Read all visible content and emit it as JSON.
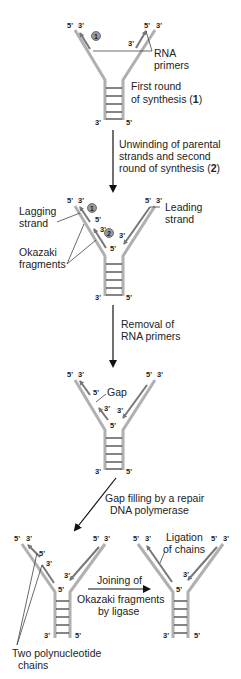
{
  "figure": {
    "stages": [
      {
        "id": "stage1",
        "labels": {
          "end_tl_5": "5'",
          "end_tl_3": "3'",
          "end_tr_5": "5'",
          "end_tr_3": "3'",
          "end_bl": "3'",
          "end_br": "5'",
          "primer_3": "3'",
          "marker": "1",
          "rna_primers_l1": "RNA",
          "rna_primers_l2": "primers",
          "desc_l1": "First round",
          "desc_l2": "of synthesis (",
          "desc_num": "1",
          "desc_close": ")"
        }
      },
      {
        "id": "stage2",
        "labels": {
          "end_tl_5": "5'",
          "end_tl_3": "3'",
          "end_tr_5": "5'",
          "end_tr_3": "3'",
          "end_bl": "3'",
          "end_br": "5'",
          "frag1_5": "5'",
          "frag2_3": "3'",
          "frag2_5": "5'",
          "lead_3": "3'",
          "marker1": "1",
          "marker2": "2",
          "lagging_l1": "Lagging",
          "lagging_l2": "strand",
          "leading_l1": "Leading",
          "leading_l2": "strand",
          "okazaki_l1": "Okazaki",
          "okazaki_l2": "fragments"
        }
      },
      {
        "id": "stage3",
        "labels": {
          "end_tl_5": "5'",
          "end_tl_3": "3'",
          "end_tr_5": "5'",
          "end_tr_3": "3'",
          "end_bl": "3'",
          "end_br": "5'",
          "frag1_5": "5'",
          "frag2_3": "3'",
          "frag2_5": "5'",
          "lead_3": "3'",
          "gap": "Gap"
        }
      },
      {
        "id": "stage4",
        "labels": {
          "end_tl_5": "5'",
          "end_tl_3": "3'",
          "end_tr_5": "5'",
          "end_tr_3": "3'",
          "end_bl": "3'",
          "end_br": "5'",
          "frag1_5": "5'",
          "frag2_3": "3'",
          "frag2_5": "5'",
          "lead_3": "3'",
          "two_chains_l1": "Two polynucleotide",
          "two_chains_l2": "chains"
        }
      },
      {
        "id": "stage5",
        "labels": {
          "end_tl_5": "5'",
          "end_tl_3": "3'",
          "end_tr_5": "5'",
          "end_tr_3": "3'",
          "end_bl": "3'",
          "end_br": "5'",
          "frag_5": "5'",
          "lead_3": "3'",
          "ligation_l1": "Ligation",
          "ligation_l2": "of chains"
        }
      }
    ],
    "steps": {
      "step1_l1": "Unwinding of parental",
      "step1_l2": "strands and second",
      "step1_l3": "round of synthesis (",
      "step1_num": "2",
      "step1_close": ")",
      "step2_l1": "Removal of",
      "step2_l2": "RNA primers",
      "step3_l1": "Gap filling by a repair",
      "step3_l2": "DNA polymerase",
      "step4_l1": "Joining of",
      "step4_l2": "Okazaki fragments",
      "step4_l3": "by ligase"
    },
    "colors": {
      "parental_strand": "#b0b0b0",
      "new_strand": "#777777",
      "arrow": "#111111",
      "marker_fill": "#9a9a9a"
    }
  }
}
